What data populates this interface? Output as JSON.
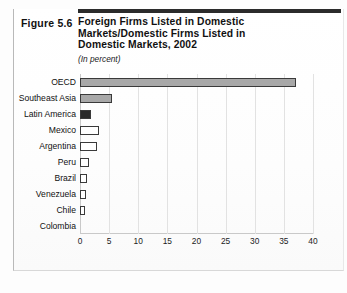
{
  "figure": {
    "number_label": "Figure 5.6",
    "title_lines": [
      "Foreign Firms Listed in Domestic",
      "Markets/Domestic Firms Listed in",
      "Domestic Markets, 2002"
    ],
    "subtitle": "(In percent)"
  },
  "colors": {
    "bar_fill_gray": "#a8a8a8",
    "bar_fill_solid": "#2a2a2a",
    "bar_fill_hollow": "#ffffff",
    "bar_border": "#3a3a3a",
    "gridline": "#e2e2e2",
    "axis": "#c9c9c9",
    "rule": "#2b2b2b"
  },
  "chart_data": {
    "type": "bar",
    "orientation": "horizontal",
    "title": "Foreign Firms Listed in Domestic Markets/Domestic Firms Listed in Domestic Markets, 2002",
    "subtitle": "(In percent)",
    "xlabel": "",
    "ylabel": "",
    "xlim": [
      0,
      40
    ],
    "xticks": [
      0,
      5,
      10,
      15,
      20,
      25,
      30,
      35,
      40
    ],
    "xtick_labels": [
      "0",
      "5",
      "10",
      "15",
      "20",
      "25",
      "30",
      "35",
      "40"
    ],
    "grid": true,
    "legend": false,
    "categories": [
      "OECD",
      "Southeast Asia",
      "Latin America",
      "Mexico",
      "Argentina",
      "Peru",
      "Brazil",
      "Venezuela",
      "Chile",
      "Colombia"
    ],
    "values": [
      37.0,
      5.5,
      1.9,
      3.3,
      2.9,
      1.5,
      1.2,
      1.1,
      0.8,
      0.0
    ],
    "bar_styles": [
      "gray",
      "gray",
      "solid",
      "hollow",
      "hollow",
      "hollow",
      "hollow",
      "hollow",
      "hollow",
      "hollow"
    ]
  }
}
